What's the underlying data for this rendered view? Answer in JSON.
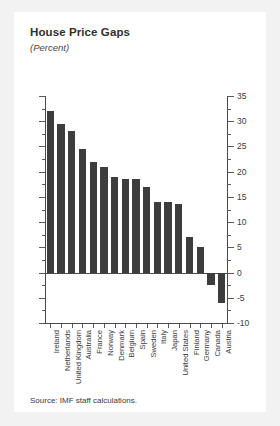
{
  "card": {
    "title": "House Price Gaps",
    "subtitle": "(Percent)",
    "source": "Source: IMF staff calculations."
  },
  "chart_data": {
    "type": "bar",
    "title": "House Price Gaps",
    "subtitle": "(Percent)",
    "xlabel": "",
    "ylabel": "",
    "ylim": [
      -10,
      35
    ],
    "y_major_ticks": [
      35,
      30,
      25,
      20,
      15,
      10,
      5,
      0,
      -5,
      -10
    ],
    "y_minor_ticks": [
      32.5,
      27.5,
      22.5,
      17.5,
      12.5,
      7.5,
      2.5,
      -2.5,
      -7.5
    ],
    "grid": false,
    "legend": "none",
    "bar_color": "#3d3d3d",
    "axis_color": "#4a4a4a",
    "categories": [
      "Ireland",
      "Netherlands",
      "United Kingdom",
      "Australia",
      "France",
      "Norway",
      "Denmark",
      "Belgium",
      "Spain",
      "Sweden",
      "Italy",
      "Japan",
      "United States",
      "Finland",
      "Germany",
      "Canada",
      "Austria"
    ],
    "values": [
      32,
      29.5,
      28,
      24.5,
      22,
      21,
      19,
      18.5,
      18.5,
      17,
      14,
      14,
      13.5,
      7,
      5,
      -2.5,
      -6
    ],
    "source": "Source: IMF staff calculations."
  }
}
